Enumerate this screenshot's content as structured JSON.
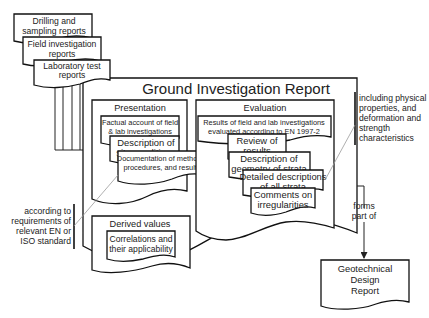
{
  "diagram": {
    "type": "flowchart",
    "inputs": [
      {
        "lines": [
          "Drilling and",
          "sampling reports"
        ]
      },
      {
        "lines": [
          "Field investigation",
          "reports"
        ]
      },
      {
        "lines": [
          "Laboratory test",
          "reports"
        ]
      }
    ],
    "main": {
      "title": "Ground Investigation Report",
      "presentation": {
        "heading": "Presentation",
        "items": [
          {
            "lines": [
              "Factual account of field",
              "& lab investigations"
            ]
          },
          {
            "lines": [
              "Description of",
              "site conditions"
            ]
          },
          {
            "lines": [
              "Documentation of methods,",
              "procedures, and results"
            ]
          }
        ]
      },
      "evaluation": {
        "heading": "Evaluation",
        "items": [
          {
            "lines": [
              "Results of field and lab investigations",
              "evaluated according to EN 1997-2"
            ]
          },
          {
            "lines": [
              "Review of",
              "results"
            ]
          },
          {
            "lines": [
              "Description of",
              "geometry of strata"
            ]
          },
          {
            "lines": [
              "Detailed descriptions",
              "of all strata"
            ]
          },
          {
            "lines": [
              "Comments on",
              "irregularities"
            ]
          }
        ]
      },
      "derived": {
        "heading": "Derived values",
        "items": [
          {
            "lines": [
              "Correlations and",
              "their applicability"
            ]
          }
        ]
      }
    },
    "annotations": {
      "left": [
        "according to",
        "requirements of",
        "relevant EN or",
        "ISO standard"
      ],
      "right": [
        "including physical",
        "properties, and",
        "deformation and",
        "strength",
        "characteristics"
      ],
      "arrow_label": [
        "forms",
        "part of"
      ]
    },
    "output": {
      "lines": [
        "Geotechnical",
        "Design",
        "Report"
      ]
    }
  }
}
